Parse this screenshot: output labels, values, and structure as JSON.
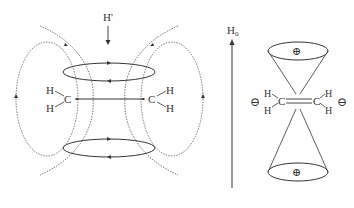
{
  "figure": {
    "left_panel": {
      "title": "Induced magnetic field in ethylene (pi-electron circulation)",
      "applied_field_label": "H'",
      "left_group": {
        "carbon": "C",
        "h_top": "H",
        "h_bottom": "H"
      },
      "right_group": {
        "carbon": "C",
        "h_top": "H",
        "h_bottom": "H"
      }
    },
    "field_axis": {
      "label": "H",
      "subscript": "0"
    },
    "right_panel": {
      "top_cone_sign": "⊕",
      "bottom_cone_sign": "⊕",
      "left_sign": "⊖",
      "right_sign": "⊖",
      "left_group": {
        "carbon": "C",
        "h_top": "H",
        "h_bottom": "H"
      },
      "right_group": {
        "carbon": "C",
        "h_top": "H",
        "h_bottom": "H"
      }
    },
    "colors": {
      "stroke": "#333333",
      "dashed": "#555555"
    }
  }
}
